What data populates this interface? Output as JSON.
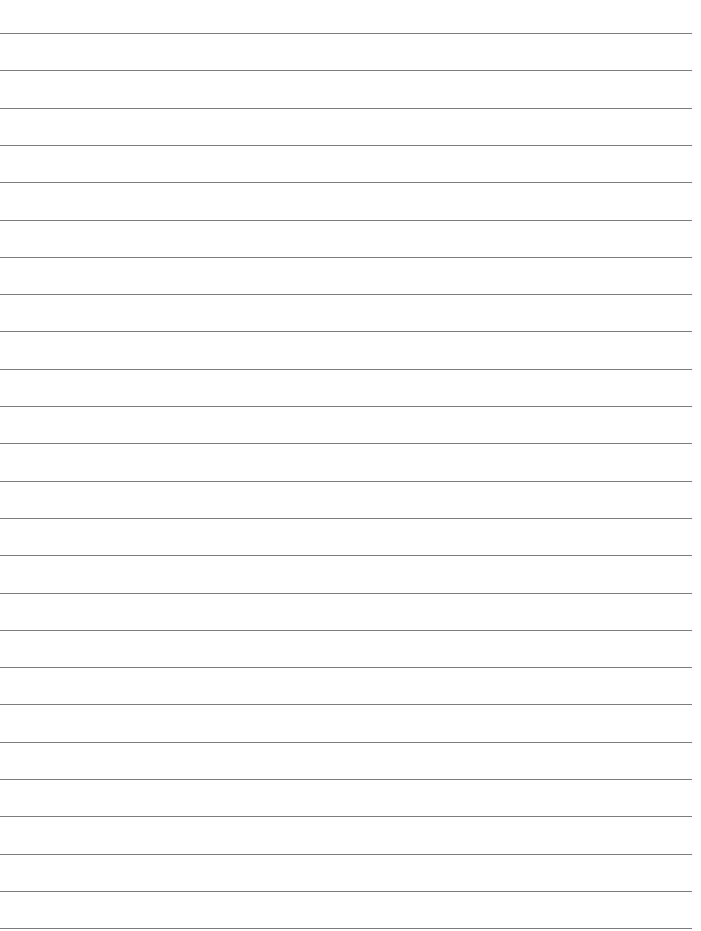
{
  "page": {
    "type": "lined-paper",
    "background_color": "#ffffff",
    "line_color": "#7c7c7c",
    "line_count": 25,
    "first_line_y": 33,
    "line_spacing": 37.3,
    "line_start_x": 0,
    "line_end_x": 692
  },
  "lines": [
    {
      "text": ""
    },
    {
      "text": ""
    },
    {
      "text": ""
    },
    {
      "text": ""
    },
    {
      "text": ""
    },
    {
      "text": ""
    },
    {
      "text": ""
    },
    {
      "text": ""
    },
    {
      "text": ""
    },
    {
      "text": ""
    },
    {
      "text": ""
    },
    {
      "text": ""
    },
    {
      "text": ""
    },
    {
      "text": ""
    },
    {
      "text": ""
    },
    {
      "text": ""
    },
    {
      "text": ""
    },
    {
      "text": ""
    },
    {
      "text": ""
    },
    {
      "text": ""
    },
    {
      "text": ""
    },
    {
      "text": ""
    },
    {
      "text": ""
    },
    {
      "text": ""
    },
    {
      "text": ""
    }
  ]
}
